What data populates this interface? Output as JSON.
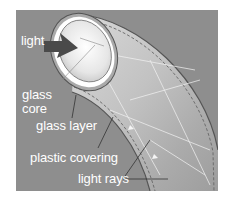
{
  "diagram": {
    "background_color": "#8e8e8e",
    "labels": {
      "light": "light",
      "glass_core_line1": "glass",
      "glass_core_line2": "core",
      "glass_layer": "glass layer",
      "plastic_covering": "plastic covering",
      "light_rays": "light rays"
    },
    "arrow": {
      "name": "light-input-arrow",
      "color": "#4a4a4a"
    }
  }
}
